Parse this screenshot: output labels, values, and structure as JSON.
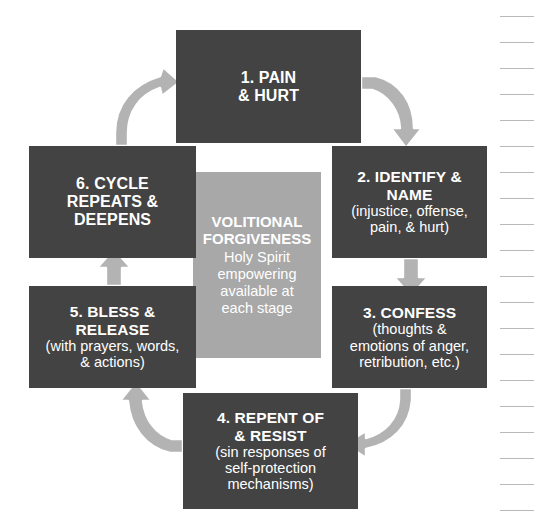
{
  "diagram": {
    "title_center": {
      "heading": "VOLITIONAL\nFORGIVENESS",
      "subtext": "Holy Spirit\nempowering\navailable at\neach stage"
    },
    "colors": {
      "box_fill": "#434343",
      "box_text": "#ffffff",
      "center_fill": "#a8a8a8",
      "arrow_fill": "#b3b3b3",
      "arrow_outline": "#ffffff",
      "page_background": "#ffffff",
      "rule_line": "#b9b9b9"
    },
    "stages": [
      {
        "id": "stage-1",
        "title": "1. PAIN\n& HURT",
        "subtext": ""
      },
      {
        "id": "stage-2",
        "title": "2. IDENTIFY &\nNAME",
        "subtext": "(injustice, offense,\npain, & hurt)"
      },
      {
        "id": "stage-3",
        "title": "3. CONFESS",
        "subtext": "(thoughts &\nemotions of anger,\nretribution, etc.)"
      },
      {
        "id": "stage-4",
        "title": "4. REPENT OF\n& RESIST",
        "subtext": "(sin responses of\nself-protection\nmechanisms)"
      },
      {
        "id": "stage-5",
        "title": "5. BLESS &\nRELEASE",
        "subtext": "(with prayers, words,\n& actions)"
      },
      {
        "id": "stage-6",
        "title": "6. CYCLE\nREPEATS &\nDEEPENS",
        "subtext": ""
      }
    ],
    "arrows": [
      {
        "id": "arrow-1-to-2",
        "from": "stage-1",
        "to": "stage-2",
        "shape": "curved"
      },
      {
        "id": "arrow-2-to-3",
        "from": "stage-2",
        "to": "stage-3",
        "shape": "straight-down"
      },
      {
        "id": "arrow-3-to-4",
        "from": "stage-3",
        "to": "stage-4",
        "shape": "curved"
      },
      {
        "id": "arrow-4-to-5",
        "from": "stage-4",
        "to": "stage-5",
        "shape": "curved"
      },
      {
        "id": "arrow-5-to-6",
        "from": "stage-5",
        "to": "stage-6",
        "shape": "straight-up"
      },
      {
        "id": "arrow-6-to-1",
        "from": "stage-6",
        "to": "stage-1",
        "shape": "curved"
      }
    ],
    "ruled_margin": {
      "line_count": 20,
      "first_line_y": 16,
      "spacing": 26
    }
  }
}
